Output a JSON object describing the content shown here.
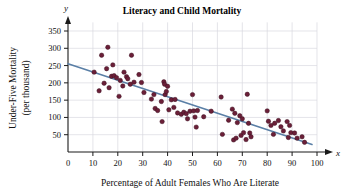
{
  "chart_data": {
    "type": "scatter",
    "title": "Literacy and Child Mortality",
    "xlabel": "Percentage of Adult Females Who Are Literate",
    "ylabel_line1": "Under-Five Mortality",
    "ylabel_line2": "(per thousand)",
    "x_axis_name": "x",
    "y_axis_name": "y",
    "xlim": [
      0,
      100
    ],
    "ylim": [
      0,
      375
    ],
    "xticks": [
      0,
      10,
      20,
      30,
      40,
      50,
      60,
      70,
      80,
      90,
      100
    ],
    "yticks": [
      50,
      100,
      150,
      200,
      250,
      300,
      350
    ],
    "grid": true,
    "grid_color": "#d8d8e0",
    "point_color": "#6b1f38",
    "point_edge_color": "#3d1020",
    "line_color": "#5a7fa6",
    "axis_color": "#1a1a1a",
    "trendline": {
      "type": "line",
      "label": "least-squares regression line",
      "x_start": 0,
      "y_start": 255,
      "x_end": 98,
      "y_end": 22,
      "slope": -2.378,
      "intercept": 255
    },
    "points": [
      [
        10.5,
        231
      ],
      [
        12.5,
        177
      ],
      [
        13.5,
        280
      ],
      [
        14.5,
        199
      ],
      [
        15.5,
        241
      ],
      [
        16.0,
        303
      ],
      [
        16.5,
        186
      ],
      [
        17.5,
        219
      ],
      [
        18.0,
        252
      ],
      [
        18.5,
        221
      ],
      [
        19.5,
        215
      ],
      [
        20.5,
        161
      ],
      [
        21.0,
        207
      ],
      [
        22.0,
        191
      ],
      [
        22.5,
        231
      ],
      [
        23.5,
        218
      ],
      [
        24.0,
        212
      ],
      [
        25.0,
        196
      ],
      [
        25.5,
        280
      ],
      [
        26.5,
        202
      ],
      [
        28.5,
        224
      ],
      [
        29.5,
        201
      ],
      [
        30.5,
        172
      ],
      [
        33.5,
        153
      ],
      [
        34.5,
        166
      ],
      [
        35.0,
        126
      ],
      [
        36.0,
        120
      ],
      [
        37.5,
        146
      ],
      [
        37.8,
        88
      ],
      [
        38.5,
        203
      ],
      [
        38.8,
        196
      ],
      [
        39.0,
        166
      ],
      [
        39.5,
        175
      ],
      [
        40.0,
        190
      ],
      [
        40.5,
        122
      ],
      [
        41.5,
        151
      ],
      [
        42.5,
        129
      ],
      [
        43.0,
        152
      ],
      [
        44.0,
        113
      ],
      [
        45.5,
        109
      ],
      [
        46.5,
        115
      ],
      [
        47.5,
        111
      ],
      [
        48.0,
        96
      ],
      [
        49.0,
        118
      ],
      [
        50.0,
        166
      ],
      [
        50.5,
        119
      ],
      [
        51.0,
        101
      ],
      [
        51.5,
        72
      ],
      [
        52.0,
        120
      ],
      [
        54.5,
        102
      ],
      [
        57.5,
        118
      ],
      [
        61.5,
        159
      ],
      [
        62.0,
        51
      ],
      [
        64.5,
        92
      ],
      [
        66.0,
        124
      ],
      [
        66.5,
        35
      ],
      [
        67.0,
        112
      ],
      [
        67.5,
        40
      ],
      [
        68.0,
        85
      ],
      [
        69.0,
        105
      ],
      [
        69.5,
        48
      ],
      [
        70.0,
        96
      ],
      [
        70.5,
        56
      ],
      [
        71.5,
        36
      ],
      [
        72.0,
        167
      ],
      [
        72.5,
        83
      ],
      [
        73.0,
        55
      ],
      [
        73.5,
        44
      ],
      [
        80.0,
        119
      ],
      [
        80.5,
        89
      ],
      [
        81.5,
        77
      ],
      [
        82.5,
        51
      ],
      [
        83.0,
        83
      ],
      [
        84.5,
        91
      ],
      [
        85.5,
        73
      ],
      [
        86.5,
        61
      ],
      [
        88.0,
        88
      ],
      [
        88.5,
        42
      ],
      [
        89.0,
        77
      ],
      [
        89.5,
        56
      ],
      [
        91.0,
        55
      ],
      [
        92.0,
        40
      ],
      [
        94.0,
        44
      ],
      [
        95.0,
        28
      ]
    ]
  }
}
